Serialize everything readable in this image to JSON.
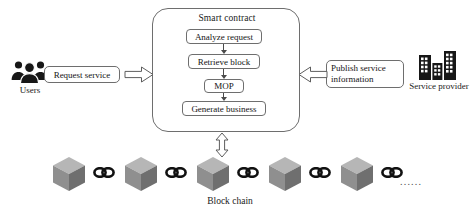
{
  "diagram": {
    "title_visible": false,
    "smart_contract": {
      "title": "Smart contract",
      "steps": [
        {
          "id": "analyze",
          "label": "Analyze request"
        },
        {
          "id": "retrieve",
          "label": "Retrieve block"
        },
        {
          "id": "mop",
          "label": "MOP"
        },
        {
          "id": "generate",
          "label": "Generate business"
        }
      ]
    },
    "actors": {
      "left": {
        "icon": "users-icon",
        "label": "Users",
        "message": "Request service",
        "arrow_direction": "right"
      },
      "right": {
        "icon": "buildings-icon",
        "label": "Service provider",
        "message_line1": "Publish service",
        "message_line2": "information",
        "arrow_direction": "left"
      }
    },
    "blockchain": {
      "label": "Block chain",
      "block_count": 5,
      "link_count": 5,
      "ellipsis": "......",
      "link_arrow": "double-headed-vertical"
    },
    "colors": {
      "stroke": "#6e6e6e",
      "text": "#1a1a1a",
      "connector": "#4a4a4a",
      "cube_top": "#b4b4b4",
      "cube_left": "#8e8e8e",
      "cube_right": "#6f6f6f",
      "background": "#ffffff"
    }
  }
}
